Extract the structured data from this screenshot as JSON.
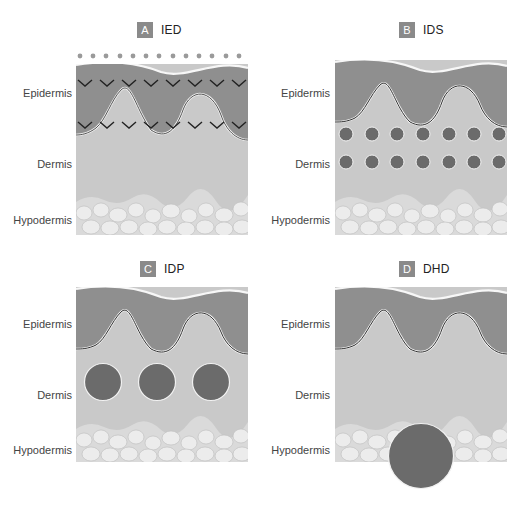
{
  "figure": {
    "layer_labels": {
      "epidermis": "Epidermis",
      "dermis": "Dermis",
      "hypodermis": "Hypodermis"
    },
    "colors": {
      "epidermis": "#8f8f8f",
      "dermis": "#c9c9c9",
      "hypodermis": "#dadada",
      "fat_cell": "#ebebeb",
      "deposit": "#6b6b6b",
      "badge": "#8a8a8a",
      "chevron": "#222222",
      "dots": "#9a9a9a"
    },
    "panels": [
      {
        "id": "A",
        "badge": "A",
        "title": "IED",
        "marker": "intraepidermal (surface dots + chevrons)"
      },
      {
        "id": "B",
        "badge": "B",
        "title": "IDS",
        "marker": "2 rows x 7 small dermal deposits"
      },
      {
        "id": "C",
        "badge": "C",
        "title": "IDP",
        "marker": "3 large dermal deposits"
      },
      {
        "id": "D",
        "badge": "D",
        "title": "DHD",
        "marker": "1 deep deposit at dermis-hypodermis junction"
      }
    ]
  }
}
